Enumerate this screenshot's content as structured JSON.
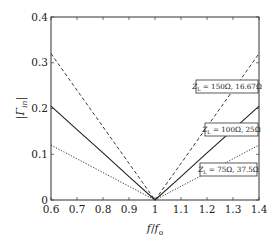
{
  "chart_data": {
    "type": "line",
    "title": "",
    "xlabel": "f/f_o",
    "ylabel": "|Γ_in|",
    "xlim": [
      0.6,
      1.4
    ],
    "ylim": [
      0,
      0.4
    ],
    "x_ticks": [
      "0.6",
      "0.7",
      "0.8",
      "0.9",
      "1",
      "1.1",
      "1.2",
      "1.3",
      "1.4"
    ],
    "y_ticks": [
      "0",
      "0.1",
      "0.2",
      "0.3",
      "0.4"
    ],
    "grid": false,
    "legend": "inline annotations",
    "x": [
      0.6,
      0.7,
      0.8,
      0.9,
      1.0,
      1.1,
      1.2,
      1.3,
      1.4
    ],
    "series": [
      {
        "name": "Z_L = 150Ω, 16.67Ω",
        "style": "dashed",
        "values": [
          0.32,
          0.24,
          0.16,
          0.08,
          0.0,
          0.08,
          0.16,
          0.24,
          0.32
        ]
      },
      {
        "name": "Z_L = 100Ω, 25Ω",
        "style": "solid",
        "values": [
          0.205,
          0.154,
          0.103,
          0.051,
          0.0,
          0.051,
          0.103,
          0.154,
          0.205
        ]
      },
      {
        "name": "Z_L = 75Ω, 37.5Ω",
        "style": "dotted",
        "values": [
          0.12,
          0.09,
          0.06,
          0.03,
          0.0,
          0.03,
          0.06,
          0.09,
          0.12
        ]
      }
    ],
    "annotations": [
      {
        "text": "Z_L = 150Ω, 16.67Ω",
        "series": 0
      },
      {
        "text": "Z_L = 100Ω, 25Ω",
        "series": 1
      },
      {
        "text": "Z_L = 75Ω, 37.5Ω",
        "series": 2
      }
    ]
  },
  "labels": {
    "ylabel_main": "|Γ",
    "ylabel_sub": "in",
    "ylabel_close": "|",
    "xlabel_f": "f",
    "xlabel_slash": "/",
    "xlabel_f0": "f",
    "xlabel_sub": "o",
    "anno": [
      {
        "pre": "Z",
        "sub": "L",
        "post": " = 150Ω, 16.67Ω"
      },
      {
        "pre": "Z",
        "sub": "L",
        "post": " = 100Ω, 25Ω"
      },
      {
        "pre": "Z",
        "sub": "L",
        "post": " = 75Ω, 37.5Ω"
      }
    ]
  },
  "colors": {
    "line": "#222222",
    "axis": "#333333",
    "background": "#ffffff"
  }
}
